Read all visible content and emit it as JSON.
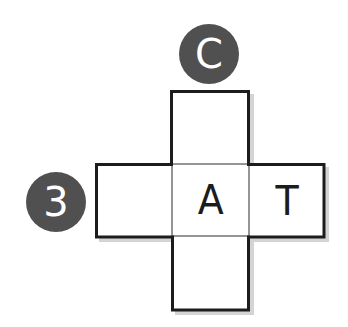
{
  "diagram": {
    "type": "cube-net-cross",
    "colors": {
      "border": "#1c1c1c",
      "badge_fill": "#505050",
      "badge_text": "#ffffff",
      "shadow": "#d4d4d4",
      "cell_fill": "#ffffff"
    },
    "cells": {
      "top": {
        "label": ""
      },
      "left": {
        "label": ""
      },
      "center": {
        "label": "A"
      },
      "right": {
        "label": "T"
      },
      "bottom": {
        "label": ""
      }
    },
    "badges": {
      "top": {
        "label": "C"
      },
      "left": {
        "label": "3"
      }
    }
  }
}
